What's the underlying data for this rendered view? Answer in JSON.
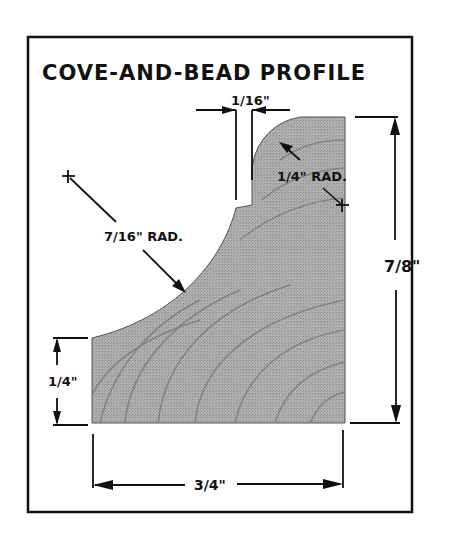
{
  "title": "COVE-AND-BEAD PROFILE",
  "dimensions": {
    "top_step_width": "1/16\"",
    "bead_radius": "1/4\" RAD.",
    "cove_radius": "7/16\" RAD.",
    "total_height": "7/8\"",
    "left_edge_height": "1/4\"",
    "total_width": "3/4\""
  },
  "colors": {
    "ink": "#111111",
    "wood_fill": "#a9a9a9",
    "wood_grain": "#7a7a7a",
    "background": "#ffffff"
  }
}
